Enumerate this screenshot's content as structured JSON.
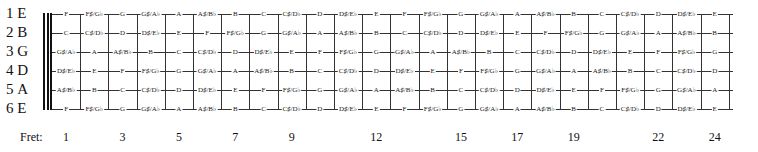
{
  "diagram": {
    "type": "guitar-fretboard-note-chart",
    "strings": [
      {
        "number": "1",
        "open": "E",
        "label": "1  E"
      },
      {
        "number": "2",
        "open": "B",
        "label": "2  B"
      },
      {
        "number": "3",
        "open": "G",
        "label": "3  G"
      },
      {
        "number": "4",
        "open": "D",
        "label": "4  D"
      },
      {
        "number": "5",
        "open": "A",
        "label": "5  A"
      },
      {
        "number": "6",
        "open": "E",
        "label": "6  E"
      }
    ],
    "notes": [
      [
        "F",
        "F♯/G♭",
        "G",
        "G♯/A♭",
        "A",
        "A♯/B♭",
        "B",
        "C",
        "C♯/D♭",
        "D",
        "D♯/E♭",
        "E",
        "F",
        "F♯/G♭",
        "G",
        "G♯/A♭",
        "A",
        "A♯/B♭",
        "B",
        "C",
        "C♯/D♭",
        "D",
        "D♯/E♭",
        "E"
      ],
      [
        "C",
        "C♯/D♭",
        "D",
        "D♯/E♭",
        "E",
        "F",
        "F♯/G♭",
        "G",
        "G♯/A♭",
        "A",
        "A♯/B♭",
        "B",
        "C",
        "C♯/D♭",
        "D",
        "D♯/E♭",
        "E",
        "F",
        "F♯/G♭",
        "G",
        "G♯/A♭",
        "A",
        "A♯/B♭",
        "B"
      ],
      [
        "G♯/A♭",
        "A",
        "A♯/B♭",
        "B",
        "C",
        "C♯/D♭",
        "D",
        "D♯/E♭",
        "E",
        "F",
        "F♯/G♭",
        "G",
        "G♯/A♭",
        "A",
        "A♯/B♭",
        "B",
        "C",
        "C♯/D♭",
        "D",
        "D♯/E♭",
        "E",
        "F",
        "F♯/G♭",
        "G"
      ],
      [
        "D♯/E♭",
        "E",
        "F",
        "F♯/G♭",
        "G",
        "G♯/A♭",
        "A",
        "A♯/B♭",
        "B",
        "C",
        "C♯/D♭",
        "D",
        "D♯/E♭",
        "E",
        "F",
        "F♯/G♭",
        "G",
        "G♯/A♭",
        "A",
        "A♯/B♭",
        "B",
        "C",
        "C♯/D♭",
        "D"
      ],
      [
        "A♯/B♭",
        "B",
        "C",
        "C♯/D♭",
        "D",
        "D♯/E♭",
        "E",
        "F",
        "F♯/G♭",
        "G",
        "G♯/A♭",
        "A",
        "A♯/B♭",
        "B",
        "C",
        "C♯/D♭",
        "D",
        "D♯/E♭",
        "E",
        "F",
        "F♯/G♭",
        "G",
        "G♯/A♭",
        "A"
      ],
      [
        "F",
        "F♯/G♭",
        "G",
        "G♯/A♭",
        "A",
        "A♯/B♭",
        "B",
        "C",
        "C♯/D♭",
        "D",
        "D♯/E♭",
        "E",
        "F",
        "F♯/G♭",
        "G",
        "G♯/A♭",
        "A",
        "A♯/B♭",
        "B",
        "C",
        "C♯/D♭",
        "D",
        "D♯/E♭",
        "E"
      ]
    ],
    "fret_caption": "Fret:",
    "fret_markers": [
      "1",
      "3",
      "5",
      "7",
      "9",
      "12",
      "15",
      "17",
      "19",
      "22",
      "24"
    ],
    "fret_count": 24
  }
}
